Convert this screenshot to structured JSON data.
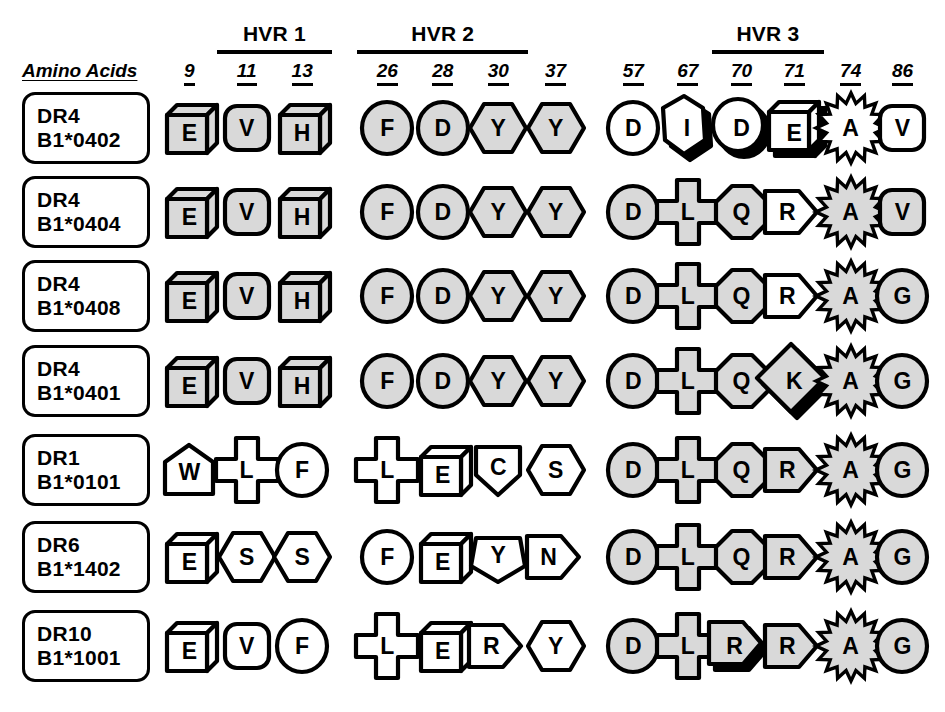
{
  "header": {
    "amino_acids_label": "Amino Acids",
    "hvr_groups": [
      {
        "label": "HVR 1",
        "positions": [
          "11",
          "13"
        ]
      },
      {
        "label": "HVR 2",
        "positions": [
          "26",
          "28",
          "30"
        ]
      },
      {
        "label": "HVR 3",
        "positions": [
          "70",
          "71"
        ]
      }
    ],
    "positions": [
      "9",
      "11",
      "13",
      "26",
      "28",
      "30",
      "37",
      "57",
      "67",
      "70",
      "71",
      "74",
      "86"
    ]
  },
  "legend": {
    "shaded_fill": "#d9d9d9",
    "outline": "#000000",
    "background": "#ffffff"
  },
  "rows": [
    {
      "allele_line1": "DR4",
      "allele_line2": "B1*0402",
      "residues": [
        {
          "pos": "9",
          "letter": "E",
          "shape": "cube",
          "fill": "shaded",
          "shadow": false
        },
        {
          "pos": "11",
          "letter": "V",
          "shape": "rounded",
          "fill": "shaded",
          "shadow": false
        },
        {
          "pos": "13",
          "letter": "H",
          "shape": "cube",
          "fill": "shaded",
          "shadow": false
        },
        {
          "pos": "26",
          "letter": "F",
          "shape": "circle",
          "fill": "shaded",
          "shadow": false
        },
        {
          "pos": "28",
          "letter": "D",
          "shape": "circle",
          "fill": "shaded",
          "shadow": false
        },
        {
          "pos": "30",
          "letter": "Y",
          "shape": "hexagon",
          "fill": "shaded",
          "shadow": false
        },
        {
          "pos": "37",
          "letter": "Y",
          "shape": "hexagon",
          "fill": "shaded",
          "shadow": false
        },
        {
          "pos": "57",
          "letter": "D",
          "shape": "circle",
          "fill": "white",
          "shadow": false
        },
        {
          "pos": "67",
          "letter": "I",
          "shape": "vhexagon",
          "fill": "white",
          "shadow": true
        },
        {
          "pos": "70",
          "letter": "D",
          "shape": "circle",
          "fill": "white",
          "shadow": true
        },
        {
          "pos": "71",
          "letter": "E",
          "shape": "cube",
          "fill": "white",
          "shadow": true
        },
        {
          "pos": "74",
          "letter": "A",
          "shape": "star",
          "fill": "white",
          "shadow": false
        },
        {
          "pos": "86",
          "letter": "V",
          "shape": "rounded",
          "fill": "white",
          "shadow": false
        }
      ]
    },
    {
      "allele_line1": "DR4",
      "allele_line2": "B1*0404",
      "residues": [
        {
          "pos": "9",
          "letter": "E",
          "shape": "cube",
          "fill": "shaded",
          "shadow": false
        },
        {
          "pos": "11",
          "letter": "V",
          "shape": "rounded",
          "fill": "shaded",
          "shadow": false
        },
        {
          "pos": "13",
          "letter": "H",
          "shape": "cube",
          "fill": "shaded",
          "shadow": false
        },
        {
          "pos": "26",
          "letter": "F",
          "shape": "circle",
          "fill": "shaded",
          "shadow": false
        },
        {
          "pos": "28",
          "letter": "D",
          "shape": "circle",
          "fill": "shaded",
          "shadow": false
        },
        {
          "pos": "30",
          "letter": "Y",
          "shape": "hexagon",
          "fill": "shaded",
          "shadow": false
        },
        {
          "pos": "37",
          "letter": "Y",
          "shape": "hexagon",
          "fill": "shaded",
          "shadow": false
        },
        {
          "pos": "57",
          "letter": "D",
          "shape": "circle",
          "fill": "shaded",
          "shadow": false
        },
        {
          "pos": "67",
          "letter": "L",
          "shape": "cross",
          "fill": "shaded",
          "shadow": false
        },
        {
          "pos": "70",
          "letter": "Q",
          "shape": "octagon",
          "fill": "shaded",
          "shadow": false
        },
        {
          "pos": "71",
          "letter": "R",
          "shape": "arrow",
          "fill": "white",
          "shadow": false
        },
        {
          "pos": "74",
          "letter": "A",
          "shape": "star",
          "fill": "shaded",
          "shadow": false
        },
        {
          "pos": "86",
          "letter": "V",
          "shape": "rounded",
          "fill": "shaded",
          "shadow": false
        }
      ]
    },
    {
      "allele_line1": "DR4",
      "allele_line2": "B1*0408",
      "residues": [
        {
          "pos": "9",
          "letter": "E",
          "shape": "cube",
          "fill": "shaded",
          "shadow": false
        },
        {
          "pos": "11",
          "letter": "V",
          "shape": "rounded",
          "fill": "shaded",
          "shadow": false
        },
        {
          "pos": "13",
          "letter": "H",
          "shape": "cube",
          "fill": "shaded",
          "shadow": false
        },
        {
          "pos": "26",
          "letter": "F",
          "shape": "circle",
          "fill": "shaded",
          "shadow": false
        },
        {
          "pos": "28",
          "letter": "D",
          "shape": "circle",
          "fill": "shaded",
          "shadow": false
        },
        {
          "pos": "30",
          "letter": "Y",
          "shape": "hexagon",
          "fill": "shaded",
          "shadow": false
        },
        {
          "pos": "37",
          "letter": "Y",
          "shape": "hexagon",
          "fill": "shaded",
          "shadow": false
        },
        {
          "pos": "57",
          "letter": "D",
          "shape": "circle",
          "fill": "shaded",
          "shadow": false
        },
        {
          "pos": "67",
          "letter": "L",
          "shape": "cross",
          "fill": "shaded",
          "shadow": false
        },
        {
          "pos": "70",
          "letter": "Q",
          "shape": "octagon",
          "fill": "shaded",
          "shadow": false
        },
        {
          "pos": "71",
          "letter": "R",
          "shape": "arrow",
          "fill": "white",
          "shadow": false
        },
        {
          "pos": "74",
          "letter": "A",
          "shape": "star",
          "fill": "shaded",
          "shadow": false
        },
        {
          "pos": "86",
          "letter": "G",
          "shape": "circle",
          "fill": "shaded",
          "shadow": false
        }
      ]
    },
    {
      "allele_line1": "DR4",
      "allele_line2": "B1*0401",
      "residues": [
        {
          "pos": "9",
          "letter": "E",
          "shape": "cube",
          "fill": "shaded",
          "shadow": false
        },
        {
          "pos": "11",
          "letter": "V",
          "shape": "rounded",
          "fill": "shaded",
          "shadow": false
        },
        {
          "pos": "13",
          "letter": "H",
          "shape": "cube",
          "fill": "shaded",
          "shadow": false
        },
        {
          "pos": "26",
          "letter": "F",
          "shape": "circle",
          "fill": "shaded",
          "shadow": false
        },
        {
          "pos": "28",
          "letter": "D",
          "shape": "circle",
          "fill": "shaded",
          "shadow": false
        },
        {
          "pos": "30",
          "letter": "Y",
          "shape": "hexagon",
          "fill": "shaded",
          "shadow": false
        },
        {
          "pos": "37",
          "letter": "Y",
          "shape": "hexagon",
          "fill": "shaded",
          "shadow": false
        },
        {
          "pos": "57",
          "letter": "D",
          "shape": "circle",
          "fill": "shaded",
          "shadow": false
        },
        {
          "pos": "67",
          "letter": "L",
          "shape": "cross",
          "fill": "shaded",
          "shadow": false
        },
        {
          "pos": "70",
          "letter": "Q",
          "shape": "octagon",
          "fill": "shaded",
          "shadow": false
        },
        {
          "pos": "71",
          "letter": "K",
          "shape": "diamond",
          "fill": "shaded",
          "shadow": true
        },
        {
          "pos": "74",
          "letter": "A",
          "shape": "star",
          "fill": "shaded",
          "shadow": false
        },
        {
          "pos": "86",
          "letter": "G",
          "shape": "circle",
          "fill": "shaded",
          "shadow": false
        }
      ]
    },
    {
      "allele_line1": "DR1",
      "allele_line2": "B1*0101",
      "residues": [
        {
          "pos": "9",
          "letter": "W",
          "shape": "house",
          "fill": "white",
          "shadow": false
        },
        {
          "pos": "11",
          "letter": "L",
          "shape": "cross",
          "fill": "white",
          "shadow": false
        },
        {
          "pos": "13",
          "letter": "F",
          "shape": "circle",
          "fill": "white",
          "shadow": false
        },
        {
          "pos": "26",
          "letter": "L",
          "shape": "cross",
          "fill": "white",
          "shadow": false
        },
        {
          "pos": "28",
          "letter": "E",
          "shape": "cube",
          "fill": "white",
          "shadow": false
        },
        {
          "pos": "30",
          "letter": "C",
          "shape": "shield",
          "fill": "white",
          "shadow": false
        },
        {
          "pos": "37",
          "letter": "S",
          "shape": "hexagon",
          "fill": "white",
          "shadow": false
        },
        {
          "pos": "57",
          "letter": "D",
          "shape": "circle",
          "fill": "shaded",
          "shadow": false
        },
        {
          "pos": "67",
          "letter": "L",
          "shape": "cross",
          "fill": "shaded",
          "shadow": false
        },
        {
          "pos": "70",
          "letter": "Q",
          "shape": "octagon",
          "fill": "shaded",
          "shadow": false
        },
        {
          "pos": "71",
          "letter": "R",
          "shape": "arrow",
          "fill": "shaded",
          "shadow": false
        },
        {
          "pos": "74",
          "letter": "A",
          "shape": "star",
          "fill": "shaded",
          "shadow": false
        },
        {
          "pos": "86",
          "letter": "G",
          "shape": "circle",
          "fill": "shaded",
          "shadow": false
        }
      ]
    },
    {
      "allele_line1": "DR6",
      "allele_line2": "B1*1402",
      "residues": [
        {
          "pos": "9",
          "letter": "E",
          "shape": "cube",
          "fill": "white",
          "shadow": false
        },
        {
          "pos": "11",
          "letter": "S",
          "shape": "hexagon",
          "fill": "white",
          "shadow": false
        },
        {
          "pos": "13",
          "letter": "S",
          "shape": "hexagon",
          "fill": "white",
          "shadow": false
        },
        {
          "pos": "26",
          "letter": "F",
          "shape": "circle",
          "fill": "white",
          "shadow": false
        },
        {
          "pos": "28",
          "letter": "E",
          "shape": "cube",
          "fill": "white",
          "shadow": false
        },
        {
          "pos": "30",
          "letter": "Y",
          "shape": "pentagon",
          "fill": "white",
          "shadow": false
        },
        {
          "pos": "37",
          "letter": "N",
          "shape": "arrow",
          "fill": "white",
          "shadow": false
        },
        {
          "pos": "57",
          "letter": "D",
          "shape": "circle",
          "fill": "shaded",
          "shadow": false
        },
        {
          "pos": "67",
          "letter": "L",
          "shape": "cross",
          "fill": "shaded",
          "shadow": false
        },
        {
          "pos": "70",
          "letter": "Q",
          "shape": "octagon",
          "fill": "shaded",
          "shadow": false
        },
        {
          "pos": "71",
          "letter": "R",
          "shape": "arrow",
          "fill": "shaded",
          "shadow": false
        },
        {
          "pos": "74",
          "letter": "A",
          "shape": "star",
          "fill": "shaded",
          "shadow": false
        },
        {
          "pos": "86",
          "letter": "G",
          "shape": "circle",
          "fill": "shaded",
          "shadow": false
        }
      ]
    },
    {
      "allele_line1": "DR10",
      "allele_line2": "B1*1001",
      "residues": [
        {
          "pos": "9",
          "letter": "E",
          "shape": "cube",
          "fill": "white",
          "shadow": false
        },
        {
          "pos": "11",
          "letter": "V",
          "shape": "rounded",
          "fill": "white",
          "shadow": false
        },
        {
          "pos": "13",
          "letter": "F",
          "shape": "circle",
          "fill": "white",
          "shadow": false
        },
        {
          "pos": "26",
          "letter": "L",
          "shape": "cross",
          "fill": "white",
          "shadow": false
        },
        {
          "pos": "28",
          "letter": "E",
          "shape": "cube",
          "fill": "white",
          "shadow": false
        },
        {
          "pos": "30",
          "letter": "R",
          "shape": "arrow",
          "fill": "white",
          "shadow": false
        },
        {
          "pos": "37",
          "letter": "Y",
          "shape": "hexagon",
          "fill": "white",
          "shadow": false
        },
        {
          "pos": "57",
          "letter": "D",
          "shape": "circle",
          "fill": "shaded",
          "shadow": false
        },
        {
          "pos": "67",
          "letter": "L",
          "shape": "cross",
          "fill": "shaded",
          "shadow": false
        },
        {
          "pos": "70",
          "letter": "R",
          "shape": "arrow",
          "fill": "shaded",
          "shadow": true
        },
        {
          "pos": "71",
          "letter": "R",
          "shape": "arrow",
          "fill": "shaded",
          "shadow": false
        },
        {
          "pos": "74",
          "letter": "A",
          "shape": "star",
          "fill": "shaded",
          "shadow": false
        },
        {
          "pos": "86",
          "letter": "G",
          "shape": "circle",
          "fill": "shaded",
          "shadow": false
        }
      ]
    }
  ],
  "layout": {
    "column_x": {
      "9": 196,
      "11": 257,
      "13": 317,
      "26": 412,
      "28": 470,
      "30": 530,
      "37": 594,
      "57": 678,
      "67": 737,
      "70": 794,
      "71": 851,
      "74": 912,
      "86": 968
    }
  }
}
